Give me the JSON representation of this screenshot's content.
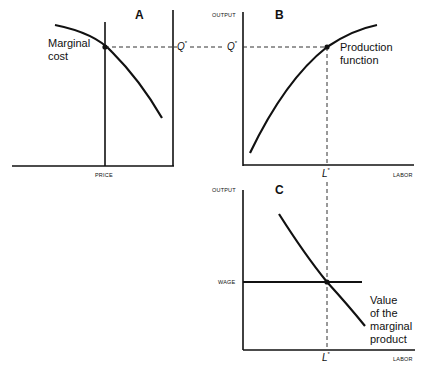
{
  "panels": {
    "A": {
      "label": "A",
      "x_axis_label": "PRICE",
      "curve_label_line1": "Marginal",
      "curve_label_line2": "cost",
      "q_star_label": "Q",
      "star": "*"
    },
    "B": {
      "label": "B",
      "y_axis_label": "OUTPUT",
      "x_axis_label": "LABOR",
      "curve_label_line1": "Production",
      "curve_label_line2": "function",
      "q_star_label": "Q",
      "l_star_label": "L",
      "star": "*"
    },
    "C": {
      "label": "C",
      "y_axis_label": "OUTPUT",
      "x_axis_label": "LABOR",
      "wage_label": "WAGE",
      "curve_label_line1": "Value",
      "curve_label_line2": "of the",
      "curve_label_line3": "marginal",
      "curve_label_line4": "product",
      "l_star_label": "L",
      "star": "*"
    }
  },
  "colors": {
    "line": "#111111",
    "dashed": "#333333",
    "background": "#ffffff"
  }
}
